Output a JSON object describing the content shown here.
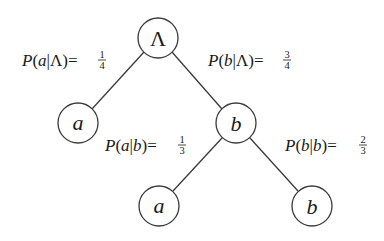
{
  "diagram": {
    "title": "",
    "colors": {
      "stroke": "#3a3a3a",
      "text": "#1a1a1a",
      "background": "#ffffff"
    },
    "nodes": [
      {
        "id": "root",
        "label": "Λ",
        "cx": 158,
        "cy": 38
      },
      {
        "id": "a1",
        "label": "a",
        "cx": 78,
        "cy": 123
      },
      {
        "id": "b1",
        "label": "b",
        "cx": 236,
        "cy": 123
      },
      {
        "id": "a2",
        "label": "a",
        "cx": 159,
        "cy": 206
      },
      {
        "id": "b2",
        "label": "b",
        "cx": 312,
        "cy": 206
      }
    ],
    "edges": [
      {
        "from": "root",
        "to": "a1",
        "label": {
          "prefix": "P(",
          "var": "a",
          "sep": "|",
          "cond": "Λ",
          "suffix": ")=",
          "num": "1",
          "den": "4"
        }
      },
      {
        "from": "root",
        "to": "b1",
        "label": {
          "prefix": "P(",
          "var": "b",
          "sep": "|",
          "cond": "Λ",
          "suffix": ")=",
          "num": "3",
          "den": "4"
        }
      },
      {
        "from": "b1",
        "to": "a2",
        "label": {
          "prefix": "P(",
          "var": "a",
          "sep": "|",
          "cond": "b",
          "suffix": ")=",
          "num": "1",
          "den": "3"
        }
      },
      {
        "from": "b1",
        "to": "b2",
        "label": {
          "prefix": "P(",
          "var": "b",
          "sep": "|",
          "cond": "b",
          "suffix": ")=",
          "num": "2",
          "den": "3"
        }
      }
    ]
  }
}
